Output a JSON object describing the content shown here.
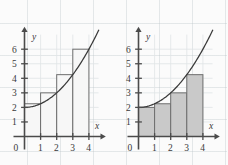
{
  "figure": {
    "background_color": "#fbfbfb",
    "grid_color": "#b9c3c8",
    "axis_color": "#4b4b4b",
    "curve_color": "#3a3a3a"
  },
  "chart_data": [
    {
      "type": "bar",
      "title": "",
      "panel": "left",
      "xlabel": "x",
      "ylabel": "y",
      "xlim": [
        0,
        4.6
      ],
      "ylim": [
        0,
        7.2
      ],
      "xticks": [
        0,
        1,
        2,
        3,
        4
      ],
      "xtick_labels": [
        "0",
        "1",
        "2",
        "3",
        "4"
      ],
      "yticks": [
        1,
        2,
        3,
        4,
        5,
        6
      ],
      "ytick_labels": [
        "1",
        "2",
        "3",
        "4",
        "5",
        "6"
      ],
      "grid": true,
      "legend": "none",
      "rectangle_rule": "right-endpoint",
      "bar_fill": "#f7f7f7",
      "bar_edge": "#6e6e6e",
      "categories": [
        "0-1",
        "1-2",
        "2-3",
        "3-4"
      ],
      "bar_intervals": [
        [
          0,
          1
        ],
        [
          1,
          2
        ],
        [
          2,
          3
        ],
        [
          3,
          4
        ]
      ],
      "values": [
        2.25,
        3,
        4.25,
        6
      ],
      "curve": {
        "label": "f(x) = 2 + x^2/4",
        "x": [
          0,
          0.5,
          1,
          1.5,
          2,
          2.5,
          3,
          3.5,
          4,
          4.5
        ],
        "y": [
          2,
          2.0625,
          2.25,
          2.5625,
          3,
          3.5625,
          4.25,
          5.0625,
          6,
          7.0625
        ]
      }
    },
    {
      "type": "bar",
      "title": "",
      "panel": "right",
      "xlabel": "x",
      "ylabel": "y",
      "xlim": [
        0,
        4.6
      ],
      "ylim": [
        0,
        7.2
      ],
      "xticks": [
        0,
        1,
        2,
        3,
        4
      ],
      "xtick_labels": [
        "0",
        "1",
        "2",
        "3",
        "4"
      ],
      "yticks": [
        1,
        2,
        3,
        4,
        5,
        6
      ],
      "ytick_labels": [
        "1",
        "2",
        "3",
        "4",
        "5",
        "6"
      ],
      "grid": true,
      "legend": "none",
      "rectangle_rule": "left-endpoint",
      "bar_fill": "#c9c9c9",
      "bar_edge": "#6e6e6e",
      "categories": [
        "0-1",
        "1-2",
        "2-3",
        "3-4"
      ],
      "bar_intervals": [
        [
          0,
          1
        ],
        [
          1,
          2
        ],
        [
          2,
          3
        ],
        [
          3,
          4
        ]
      ],
      "values": [
        2,
        2.25,
        3,
        4.25
      ],
      "curve": {
        "label": "f(x) = 2 + x^2/4",
        "x": [
          0,
          0.5,
          1,
          1.5,
          2,
          2.5,
          3,
          3.5,
          4,
          4.5
        ],
        "y": [
          2,
          2.0625,
          2.25,
          2.5625,
          3,
          3.5625,
          4.25,
          5.0625,
          6,
          7.0625
        ]
      }
    }
  ]
}
